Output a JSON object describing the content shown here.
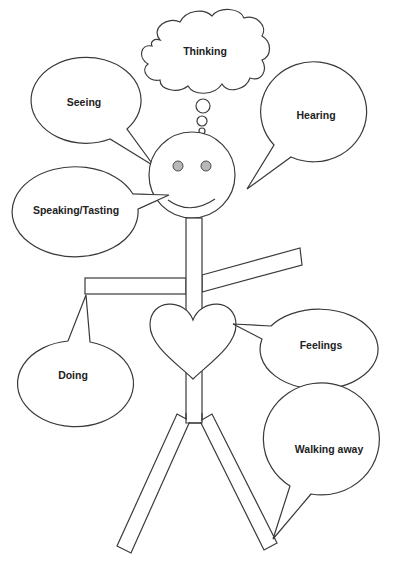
{
  "diagram": {
    "type": "stick-figure-senses",
    "colors": {
      "stroke": "#3a3a3a",
      "eye_fill": "#b8b8b8",
      "background": "#ffffff",
      "text": "#222222"
    },
    "bubbles": {
      "thinking": {
        "label": "Thinking",
        "shape": "thought-cloud"
      },
      "seeing": {
        "label": "Seeing",
        "shape": "speech-ellipse"
      },
      "hearing": {
        "label": "Hearing",
        "shape": "speech-ellipse"
      },
      "speaking": {
        "label": "Speaking/Tasting",
        "shape": "speech-ellipse"
      },
      "doing": {
        "label": "Doing",
        "shape": "speech-ellipse"
      },
      "feelings": {
        "label": "Feelings",
        "shape": "speech-ellipse"
      },
      "walking": {
        "label": "Walking away",
        "shape": "speech-ellipse"
      }
    },
    "figure": {
      "parts": [
        "head",
        "eyes",
        "smile",
        "body",
        "left-arm",
        "right-arm",
        "heart",
        "left-leg",
        "right-leg"
      ]
    }
  }
}
